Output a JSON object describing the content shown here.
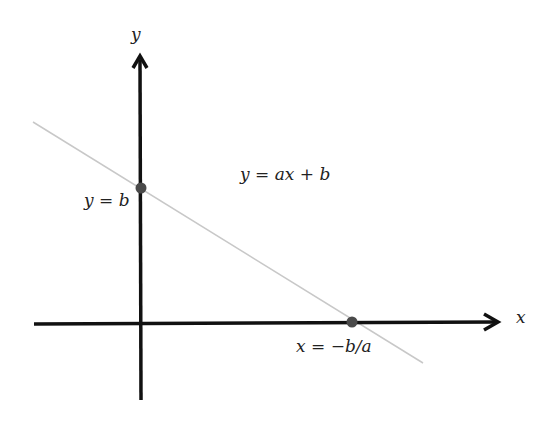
{
  "diagram": {
    "type": "linear-function-graph",
    "axes": {
      "x_label": "x",
      "y_label": "y"
    },
    "equation": "y = ax + b",
    "points": [
      {
        "name": "y-intercept",
        "label": "y = b"
      },
      {
        "name": "x-intercept",
        "label": "x = −b/a"
      }
    ],
    "colors": {
      "axis": "#111111",
      "line": "#c8c8c8",
      "point": "#4a4a4a"
    }
  }
}
